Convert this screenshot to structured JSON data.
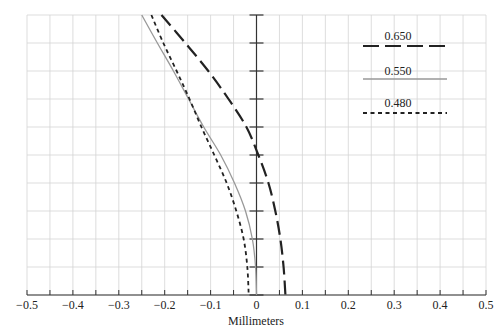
{
  "chart_data": {
    "type": "line",
    "title": "",
    "xlabel": "Millimeters",
    "ylabel": "",
    "xlim": [
      -0.5,
      0.5
    ],
    "ylim": [
      0,
      10
    ],
    "grid": true,
    "legend_position": "upper-right",
    "x_ticks": [
      -0.5,
      -0.4,
      -0.3,
      -0.2,
      -0.1,
      0,
      0.1,
      0.2,
      0.3,
      0.4,
      0.5
    ],
    "x_tick_labels": [
      "−0.5",
      "−0.4",
      "−0.3",
      "−0.2",
      "−0.1",
      "0",
      "0.1",
      "0.2",
      "0.3",
      "0.4",
      "0.5"
    ],
    "y_levels": [
      10,
      9,
      8,
      7,
      6,
      5,
      4,
      3,
      2,
      1,
      0
    ],
    "series": [
      {
        "name": "0.650",
        "style": "long-dash",
        "color": "#222222",
        "x": [
          -0.207,
          -0.155,
          -0.105,
          -0.061,
          -0.022,
          0.004,
          0.026,
          0.041,
          0.052,
          0.059,
          0.063
        ],
        "y": [
          10,
          9,
          8,
          7,
          6,
          5,
          4,
          3,
          2,
          1,
          0
        ]
      },
      {
        "name": "0.550",
        "style": "solid",
        "color": "#999999",
        "x": [
          -0.25,
          -0.216,
          -0.181,
          -0.148,
          -0.115,
          -0.078,
          -0.048,
          -0.024,
          -0.009,
          -0.002,
          0.0
        ],
        "y": [
          10,
          9,
          8,
          7,
          6,
          5,
          4,
          3,
          2,
          1,
          0
        ]
      },
      {
        "name": "0.480",
        "style": "short-dash",
        "color": "#222222",
        "x": [
          -0.229,
          -0.203,
          -0.174,
          -0.146,
          -0.12,
          -0.092,
          -0.065,
          -0.044,
          -0.028,
          -0.02,
          -0.017
        ],
        "y": [
          10,
          9,
          8,
          7,
          6,
          5,
          4,
          3,
          2,
          1,
          0
        ]
      }
    ]
  },
  "legend": {
    "items": [
      {
        "label": "0.650"
      },
      {
        "label": "0.550"
      },
      {
        "label": "0.480"
      }
    ]
  },
  "axis": {
    "x_title": "Millimeters"
  }
}
